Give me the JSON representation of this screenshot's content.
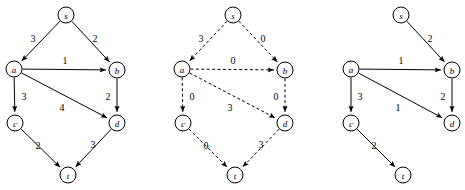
{
  "figure": {
    "title": "",
    "background_color": "#ffffff",
    "stroke_color": "#000000",
    "node_fill_color": "#ffffff",
    "width": 465,
    "height": 190
  },
  "chart_data": {
    "type": "diagram",
    "subtype": "directed-weighted-graph-triptych",
    "title": "",
    "xlabel": "",
    "ylabel": "",
    "grid": false,
    "legend": "none",
    "node_radius": 8,
    "graphs": [
      {
        "id": "graph-left",
        "name": "left-graph",
        "caption": "",
        "line_style": "solid",
        "nodes": [
          {
            "id": "s",
            "label": "s",
            "x": 66,
            "y": 15
          },
          {
            "id": "a",
            "label": "a",
            "x": 14,
            "y": 69
          },
          {
            "id": "b",
            "label": "b",
            "x": 117,
            "y": 70
          },
          {
            "id": "c",
            "label": "c",
            "x": 15,
            "y": 123
          },
          {
            "id": "d",
            "label": "d",
            "x": 117,
            "y": 123
          },
          {
            "id": "t",
            "label": "t",
            "x": 68,
            "y": 175
          }
        ],
        "edges": [
          {
            "from": "s",
            "to": "a",
            "weight": "3",
            "lx": 33,
            "ly": 38
          },
          {
            "from": "s",
            "to": "b",
            "weight": "2",
            "lx": 95,
            "ly": 38
          },
          {
            "from": "a",
            "to": "b",
            "weight": "1",
            "lx": 65,
            "ly": 60
          },
          {
            "from": "a",
            "to": "c",
            "weight": "3",
            "lx": 24,
            "ly": 96
          },
          {
            "from": "a",
            "to": "d",
            "weight": "4",
            "lx": 62,
            "ly": 107
          },
          {
            "from": "b",
            "to": "d",
            "weight": "2",
            "lx": 108,
            "ly": 96
          },
          {
            "from": "c",
            "to": "t",
            "weight": "2",
            "lx": 38,
            "ly": 145
          },
          {
            "from": "d",
            "to": "t",
            "weight": "3",
            "lx": 93,
            "ly": 144
          }
        ]
      },
      {
        "id": "graph-middle",
        "name": "middle-graph",
        "caption": "",
        "line_style": "dashed",
        "nodes": [
          {
            "id": "s",
            "label": "s",
            "x": 233,
            "y": 15
          },
          {
            "id": "a",
            "label": "a",
            "x": 182,
            "y": 69
          },
          {
            "id": "b",
            "label": "b",
            "x": 285,
            "y": 70
          },
          {
            "id": "c",
            "label": "c",
            "x": 183,
            "y": 123
          },
          {
            "id": "d",
            "label": "d",
            "x": 285,
            "y": 123
          },
          {
            "id": "t",
            "label": "t",
            "x": 235,
            "y": 175
          }
        ],
        "edges": [
          {
            "from": "s",
            "to": "a",
            "weight": "3",
            "lx": 201,
            "ly": 38
          },
          {
            "from": "s",
            "to": "b",
            "weight": "0",
            "lx": 263,
            "ly": 38
          },
          {
            "from": "a",
            "to": "b",
            "weight": "0",
            "lx": 233,
            "ly": 60
          },
          {
            "from": "a",
            "to": "c",
            "weight": "0",
            "lx": 192,
            "ly": 96
          },
          {
            "from": "a",
            "to": "d",
            "weight": "3",
            "lx": 230,
            "ly": 107
          },
          {
            "from": "b",
            "to": "d",
            "weight": "0",
            "lx": 276,
            "ly": 96
          },
          {
            "from": "c",
            "to": "t",
            "weight": "0",
            "lx": 206,
            "ly": 145
          },
          {
            "from": "d",
            "to": "t",
            "weight": "3",
            "lx": 261,
            "ly": 144
          }
        ]
      },
      {
        "id": "graph-right",
        "name": "right-graph",
        "caption": "",
        "line_style": "solid",
        "nodes": [
          {
            "id": "s",
            "label": "s",
            "x": 401,
            "y": 15
          },
          {
            "id": "a",
            "label": "a",
            "x": 351,
            "y": 69
          },
          {
            "id": "b",
            "label": "b",
            "x": 452,
            "y": 70
          },
          {
            "id": "c",
            "label": "c",
            "x": 351,
            "y": 123
          },
          {
            "id": "d",
            "label": "d",
            "x": 452,
            "y": 123
          },
          {
            "id": "t",
            "label": "t",
            "x": 403,
            "y": 175
          }
        ],
        "edges": [
          {
            "from": "s",
            "to": "b",
            "weight": "2",
            "lx": 430,
            "ly": 38
          },
          {
            "from": "a",
            "to": "b",
            "weight": "1",
            "lx": 401,
            "ly": 60
          },
          {
            "from": "a",
            "to": "c",
            "weight": "3",
            "lx": 360,
            "ly": 96
          },
          {
            "from": "a",
            "to": "d",
            "weight": "1",
            "lx": 398,
            "ly": 107
          },
          {
            "from": "b",
            "to": "d",
            "weight": "2",
            "lx": 443,
            "ly": 96
          },
          {
            "from": "c",
            "to": "t",
            "weight": "2",
            "lx": 374,
            "ly": 145
          }
        ]
      }
    ]
  }
}
